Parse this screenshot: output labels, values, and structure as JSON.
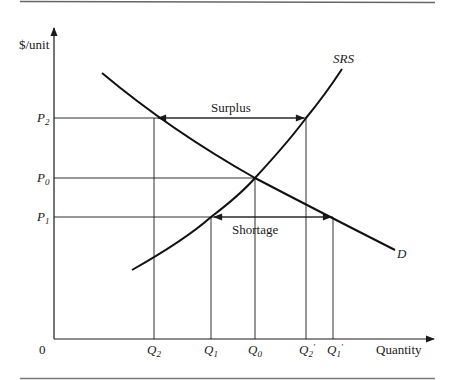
{
  "figure": {
    "y_axis_label": "$/unit",
    "x_axis_label": "Quantity",
    "origin_label": "0",
    "supply_label": "SRS",
    "demand_label": "D",
    "surplus_label": "Surplus",
    "shortage_label": "Shortage",
    "price_levels": [
      {
        "base": "P",
        "sub": "2",
        "prime": ""
      },
      {
        "base": "P",
        "sub": "0",
        "prime": ""
      },
      {
        "base": "P",
        "sub": "1",
        "prime": ""
      }
    ],
    "quantity_levels": [
      {
        "base": "Q",
        "sub": "2",
        "prime": ""
      },
      {
        "base": "Q",
        "sub": "1",
        "prime": ""
      },
      {
        "base": "Q",
        "sub": "0",
        "prime": ""
      },
      {
        "base": "Q",
        "sub": "2",
        "prime": "′"
      },
      {
        "base": "Q",
        "sub": "1",
        "prime": "′"
      }
    ],
    "colors": {
      "ink": "#1a1a1a",
      "rule": "#555555",
      "background": "#ffffff"
    }
  }
}
